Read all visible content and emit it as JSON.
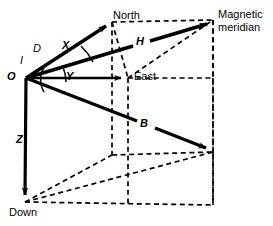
{
  "figure": {
    "colors": {
      "stroke": "#000000",
      "background": "#ffffff"
    }
  },
  "labels": {
    "origin": "O",
    "inclination": "I",
    "declination": "D",
    "north_component": "X",
    "east_component": "Y",
    "vertical_component": "Z",
    "horizontal_intensity": "H",
    "total_field": "B",
    "north": "North",
    "east": "East",
    "down": "Down",
    "magnetic_meridian_line1": "Magnetic",
    "magnetic_meridian_line2": "meridian"
  },
  "geometry": {
    "origin": [
      26,
      78
    ],
    "north_tip": [
      112,
      22
    ],
    "east_tip": [
      128,
      78
    ],
    "down_tip": [
      25,
      202
    ],
    "h_tip": [
      213,
      20
    ],
    "b_tip": [
      213,
      152
    ],
    "cube_corners": {
      "top_back_left": [
        112,
        22
      ],
      "top_back_right": [
        213,
        20
      ],
      "top_front_right": [
        213,
        78
      ],
      "top_front_left": [
        128,
        78
      ],
      "bottom_back_left": [
        112,
        155
      ],
      "bottom_back_right": [
        213,
        152
      ],
      "bottom_front_right": [
        213,
        205
      ],
      "bottom_front_left": [
        25,
        202
      ]
    }
  }
}
